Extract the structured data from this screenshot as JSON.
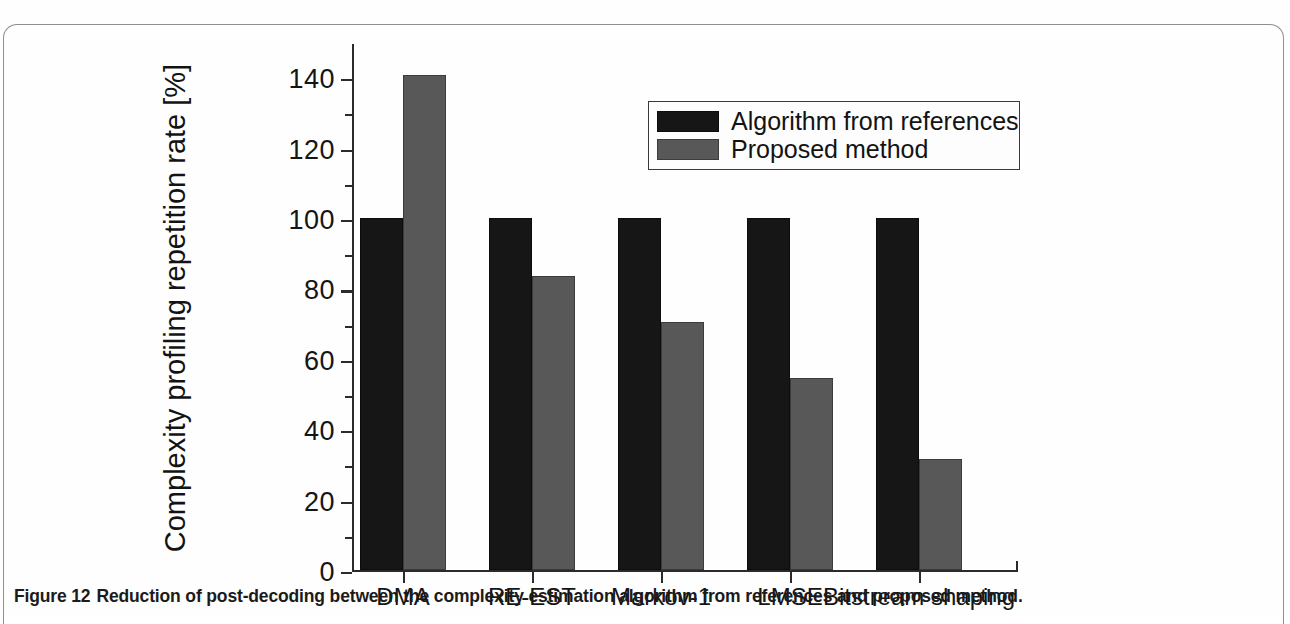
{
  "caption": {
    "label": "Figure 12",
    "text": "Reduction of post-decoding between the complexity estimation algorithm from references and proposed method."
  },
  "colors": {
    "series_reference": "#161616",
    "series_proposed": "#585858",
    "axis": "#2b2b2b",
    "text": "#131313",
    "frame_border": "#8d8f92",
    "background": "#fefefe"
  },
  "legend": {
    "position": "top-right-inside",
    "entries": [
      {
        "label": "Algorithm from references",
        "swatch": "#161616"
      },
      {
        "label": "Proposed method",
        "swatch": "#585858"
      }
    ]
  },
  "axes": {
    "y_title": "Complexity profiling repetition rate [%]",
    "y_ticks": [
      "0",
      "20",
      "40",
      "60",
      "80",
      "100",
      "120",
      "140"
    ],
    "y_min": 0,
    "y_max": 150,
    "x_title": ""
  },
  "chart_data": {
    "type": "bar",
    "title": "",
    "subtitle": "",
    "xlabel": "",
    "ylabel": "Complexity profiling repetition rate [%]",
    "ylim": [
      0,
      150
    ],
    "ytick_values": [
      0,
      20,
      40,
      60,
      80,
      100,
      120,
      140
    ],
    "minor_ticks": true,
    "grid": false,
    "legend_position": "upper right",
    "categories": [
      "DMA",
      "RE-EST",
      "Markov-1",
      "LMSE",
      "Bitstream shaping"
    ],
    "series": [
      {
        "name": "Algorithm from references",
        "color": "#161616",
        "values": [
          100,
          100,
          100,
          100,
          100
        ]
      },
      {
        "name": "Proposed method",
        "color": "#585858",
        "values": [
          140.5,
          83.5,
          70.5,
          54.5,
          31.5
        ]
      }
    ]
  }
}
